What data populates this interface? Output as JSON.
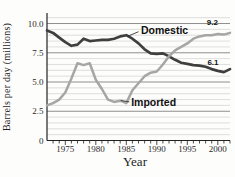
{
  "figure": {
    "background": "#fdfdfc"
  },
  "chart_data": {
    "type": "line",
    "title": "",
    "xlabel": "Year",
    "ylabel": "Barrels per day (millions)",
    "xlim": [
      1972,
      2002
    ],
    "ylim": [
      0,
      10.9
    ],
    "grid": "horizontal",
    "minor_grid_step": 0.5,
    "legend_position": "inline-annotations",
    "x": [
      1972,
      1973,
      1974,
      1975,
      1976,
      1977,
      1978,
      1979,
      1980,
      1981,
      1982,
      1983,
      1984,
      1985,
      1986,
      1987,
      1988,
      1989,
      1990,
      1991,
      1992,
      1993,
      1994,
      1995,
      1996,
      1997,
      1998,
      1999,
      2000,
      2001,
      2002
    ],
    "series": [
      {
        "name": "Domestic",
        "color": "#3f3f3f",
        "stroke_width": 2.7,
        "values": [
          9.4,
          9.2,
          8.8,
          8.4,
          8.1,
          8.2,
          8.7,
          8.5,
          8.55,
          8.6,
          8.6,
          8.7,
          8.9,
          9.0,
          8.7,
          8.3,
          7.8,
          7.45,
          7.4,
          7.45,
          7.2,
          6.9,
          6.65,
          6.55,
          6.45,
          6.4,
          6.3,
          6.1,
          5.95,
          5.85,
          6.1
        ]
      },
      {
        "name": "Imported",
        "color": "#a6a6a6",
        "stroke_width": 2.5,
        "values": [
          3.0,
          3.2,
          3.5,
          4.1,
          5.3,
          6.6,
          6.45,
          6.6,
          5.2,
          4.4,
          3.5,
          3.3,
          3.4,
          3.2,
          4.3,
          4.9,
          5.5,
          5.8,
          5.9,
          6.5,
          7.2,
          7.7,
          8.0,
          8.3,
          8.7,
          8.9,
          9.0,
          9.0,
          9.1,
          9.05,
          9.2
        ]
      }
    ],
    "x_major_ticks": [
      1975,
      1980,
      1985,
      1990,
      1995,
      2000
    ],
    "x_tick_labels": [
      "1975",
      "1980",
      "1985",
      "1990",
      "1995",
      "2000"
    ],
    "y_tick_values": [
      0,
      2.5,
      5.0,
      7.5,
      10.0
    ],
    "y_tick_labels": [
      "0",
      "2.5",
      "5.0",
      "7.5",
      "10.0"
    ],
    "y_major_grid": [
      2.5,
      5.0,
      7.5,
      10.0
    ],
    "colors": {
      "axis": "#222222",
      "grid_major": "#8f8f8f",
      "grid_minor": "#d6d6d6",
      "leader": "#333333"
    },
    "annotations": [
      {
        "name": "domestic-series-label",
        "text": "Domestic",
        "x": 1987.4,
        "y": 9.1,
        "anchor": "start",
        "font_size": 10.5,
        "leader": {
          "x1": 1987.0,
          "y1": 9.3,
          "x2": 1985.2,
          "y2": 8.9
        }
      },
      {
        "name": "imported-series-label",
        "text": "Imported",
        "x": 1985.8,
        "y": 2.95,
        "anchor": "start",
        "font_size": 10.5,
        "leader": {
          "x1": 1985.5,
          "y1": 3.3,
          "x2": 1984.1,
          "y2": 3.42
        }
      },
      {
        "name": "imported-end-value",
        "text": "9.2",
        "x": 1998.2,
        "y": 9.9,
        "anchor": "start",
        "font_size": 8
      },
      {
        "name": "domestic-end-value",
        "text": "6.1",
        "x": 1998.3,
        "y": 6.45,
        "anchor": "start",
        "font_size": 8
      }
    ]
  }
}
